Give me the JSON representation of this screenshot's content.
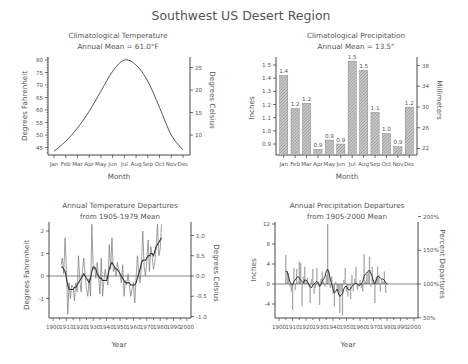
{
  "figure_title": "Southwest US Desert Region",
  "colors": {
    "line": "#444444",
    "axis": "#333333",
    "bar_fill": "#bdbdbd",
    "bar_hatch": "#8a8a8a",
    "text": "#555555",
    "bar2": "#a8a8a8"
  },
  "chart_data": [
    {
      "id": "temp_clim",
      "type": "line",
      "title": "Climatological Temperature",
      "subtitle": "Annual Mean = 61.0°F",
      "xlabel": "Month",
      "ylabel": "Degrees Fahrenheit",
      "ylabel_right": "Degrees Celsius",
      "categories": [
        "Jan",
        "Feb",
        "Mar",
        "Apr",
        "May",
        "Jun",
        "Jul",
        "Aug",
        "Sep",
        "Oct",
        "Nov",
        "Dec"
      ],
      "values": [
        43.5,
        47.5,
        52.8,
        59.5,
        67.5,
        75.5,
        80.0,
        78.0,
        71.5,
        61.0,
        50.0,
        44.0
      ],
      "yticks": [
        45,
        50,
        55,
        60,
        65,
        70,
        75,
        80
      ],
      "yticks_right": [
        10,
        15,
        20,
        25
      ],
      "ylim": [
        42,
        81
      ],
      "grid": false
    },
    {
      "id": "precip_clim",
      "type": "bar",
      "title": "Climatological Precipitation",
      "subtitle": "Annual Mean = 13.5\"",
      "xlabel": "Month",
      "ylabel": "Inches",
      "ylabel_right": "Millimeters",
      "categories": [
        "Jan",
        "Feb",
        "Mar",
        "Apr",
        "May",
        "Jun",
        "Jul",
        "Aug",
        "Sep",
        "Oct",
        "Nov",
        "Dec"
      ],
      "values": [
        1.42,
        1.17,
        1.21,
        0.86,
        0.93,
        0.9,
        1.53,
        1.46,
        1.14,
        0.98,
        0.88,
        1.18
      ],
      "data_labels": [
        "1.4",
        "1.2",
        "1.2",
        "0.9",
        "0.9",
        "0.9",
        "1.5",
        "1.5",
        "1.1",
        "1.0",
        "0.9",
        "1.2"
      ],
      "yticks": [
        "0.9",
        "1.0",
        "1.1",
        "1.2",
        "1.3",
        "1.4",
        "1.5"
      ],
      "yticks_right": [
        "22",
        "26",
        "30",
        "34",
        "38"
      ],
      "ylim": [
        0.82,
        1.54
      ],
      "grid": false
    },
    {
      "id": "temp_dep",
      "type": "line",
      "title": "Annual Temperature Departures",
      "subtitle": "from 1905-1979 Mean",
      "xlabel": "Year",
      "ylabel": "Degrees Fahrenheit",
      "ylabel_right": "Degrees Celsius",
      "x_start": 1906,
      "series": [
        {
          "name": "annual",
          "values": [
            0.5,
            0.8,
            0.1,
            1.7,
            0.3,
            -1.7,
            -0.3,
            -1.0,
            -0.4,
            -0.5,
            -1.1,
            -0.3,
            -0.7,
            0.9,
            -0.2,
            -0.7,
            0.3,
            0.8,
            0.0,
            -0.6,
            -0.9,
            -0.1,
            -0.9,
            2.3,
            0.3,
            0.4,
            -0.1,
            0.6,
            0.0,
            -0.8,
            0.8,
            -0.9,
            -0.2,
            0.3,
            -0.1,
            -0.4,
            1.4,
            0.3,
            1.7,
            0.2,
            0.4,
            0.0,
            0.6,
            0.3,
            0.1,
            -0.3,
            0.5,
            -0.9,
            -0.2,
            -0.4,
            0.1,
            -0.4,
            -0.9,
            -0.6,
            -0.3,
            -1.2,
            -0.1,
            0.9,
            0.1,
            -0.3,
            0.4,
            2.0,
            0.4,
            0.0,
            0.6,
            1.6,
            0.2,
            1.3,
            0.9,
            0.3,
            0.6,
            1.3,
            2.3,
            0.9,
            1.2,
            2.3
          ]
        },
        {
          "name": "smoothed",
          "values": [
            0.4,
            0.4,
            0.3,
            0.2,
            -0.1,
            -0.4,
            -0.6,
            -0.6,
            -0.6,
            -0.6,
            -0.5,
            -0.5,
            -0.4,
            -0.3,
            -0.2,
            -0.1,
            0.0,
            0.1,
            0.0,
            -0.1,
            -0.2,
            -0.3,
            -0.1,
            0.2,
            0.4,
            0.4,
            0.3,
            0.1,
            0.0,
            -0.1,
            -0.1,
            -0.2,
            -0.2,
            -0.2,
            -0.2,
            0.0,
            0.3,
            0.5,
            0.6,
            0.5,
            0.4,
            0.3,
            0.3,
            0.2,
            0.1,
            0.0,
            -0.1,
            -0.2,
            -0.3,
            -0.3,
            -0.3,
            -0.3,
            -0.4,
            -0.4,
            -0.4,
            -0.4,
            -0.3,
            -0.1,
            0.1,
            0.3,
            0.6,
            0.7,
            0.7,
            0.7,
            0.8,
            0.9,
            0.9,
            1.0,
            1.0,
            0.9,
            1.1,
            1.3,
            1.4,
            1.5,
            1.6,
            1.7
          ]
        }
      ],
      "xticks": [
        "1900",
        "1910",
        "1920",
        "1930",
        "1940",
        "1950",
        "1960",
        "1970",
        "1980",
        "1990",
        "2000"
      ],
      "yticks": [
        "-1",
        "0",
        "1",
        "2"
      ],
      "yticks_right": [
        "-1.0",
        "-0.5",
        "0.0",
        "0.5",
        "1.0"
      ],
      "xlim": [
        1897,
        2003
      ],
      "ylim": [
        -1.85,
        2.45
      ],
      "grid": false
    },
    {
      "id": "precip_dep",
      "type": "bar",
      "title": "Annual Precipitation Departures",
      "subtitle": "from 1905-2000 Mean",
      "xlabel": "Year",
      "ylabel": "Inches",
      "ylabel_right": "Percent Departures",
      "x_start": 1905,
      "series": [
        {
          "name": "annual",
          "values": [
            5.8,
            2.5,
            2.2,
            -0.5,
            -1.5,
            -5.2,
            3.2,
            -1.2,
            3.0,
            0.5,
            4.5,
            4.2,
            -4.5,
            1.5,
            3.5,
            0.8,
            1.2,
            -0.5,
            -3.8,
            1.0,
            3.0,
            -2.0,
            -0.8,
            3.2,
            0.5,
            -4.2,
            1.0,
            2.5,
            0.5,
            -0.5,
            1.8,
            12.0,
            2.5,
            -0.8,
            1.5,
            -2.0,
            -4.5,
            0.5,
            -1.0,
            -2.2,
            -5.8,
            -1.5,
            -6.3,
            0.8,
            3.2,
            -1.5,
            -2.5,
            -0.3,
            -3.0,
            1.8,
            -1.5,
            1.0,
            3.5,
            -1.2,
            -0.5,
            0.8,
            -0.8,
            -1.5,
            6.0,
            0.5,
            2.0,
            2.5,
            5.5,
            -0.5,
            3.5,
            0.8,
            -3.8,
            1.5,
            3.5,
            1.8,
            -1.5,
            1.0,
            0.5,
            2.5,
            -1.8,
            0.3
          ]
        },
        {
          "name": "smoothed",
          "values": [
            2.5,
            2.5,
            1.5,
            0.5,
            0.0,
            -0.2,
            0.5,
            0.8,
            1.2,
            1.5,
            1.2,
            0.8,
            0.5,
            0.2,
            0.8,
            0.8,
            0.5,
            0.0,
            -0.5,
            -0.8,
            -0.2,
            0.0,
            0.3,
            0.5,
            0.2,
            -0.5,
            -0.2,
            0.5,
            1.0,
            1.5,
            2.5,
            3.0,
            2.2,
            1.0,
            0.0,
            -1.0,
            -1.8,
            -1.5,
            -1.0,
            -1.8,
            -2.5,
            -2.2,
            -2.0,
            -1.0,
            -0.5,
            -0.5,
            -1.0,
            -1.2,
            -1.0,
            -0.5,
            -0.2,
            0.0,
            0.2,
            0.0,
            -0.3,
            -0.2,
            0.0,
            0.5,
            1.5,
            2.0,
            2.2,
            2.5,
            2.8,
            2.2,
            1.5,
            0.5,
            0.0,
            0.8,
            1.5,
            1.5,
            1.2,
            1.0,
            1.0,
            0.8,
            0.2,
            0.0
          ]
        }
      ],
      "xticks": [
        "1900",
        "1910",
        "1920",
        "1930",
        "1940",
        "1950",
        "1960",
        "1970",
        "1980",
        "1990",
        "2000"
      ],
      "yticks": [
        "-4",
        "0",
        "4",
        "8",
        "12"
      ],
      "yticks_right": [
        "50%",
        "100%",
        "150%",
        "200%"
      ],
      "xlim": [
        1897,
        2003
      ],
      "ylim": [
        -6.5,
        12.5
      ],
      "grid": false
    }
  ]
}
